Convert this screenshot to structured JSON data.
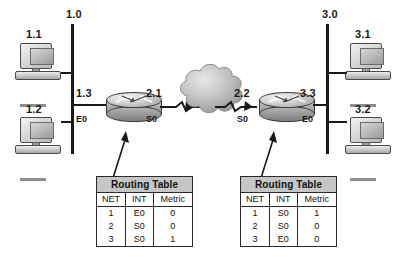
{
  "diagram": {
    "networks": [
      {
        "id": "net-left",
        "label": "1.0"
      },
      {
        "id": "net-right",
        "label": "3.0"
      }
    ],
    "workstations": [
      {
        "id": "pc-1-1",
        "label": "1.1"
      },
      {
        "id": "pc-1-2",
        "label": "1.2"
      },
      {
        "id": "pc-3-1",
        "label": "3.1"
      },
      {
        "id": "pc-3-2",
        "label": "3.2"
      }
    ],
    "routers": [
      {
        "id": "router-left",
        "left_address": "1.3",
        "left_interface": "E0",
        "right_address": "2.1",
        "right_interface": "S0"
      },
      {
        "id": "router-right",
        "left_address": "2.2",
        "left_interface": "S0",
        "right_address": "3.3",
        "right_interface": "E0"
      }
    ],
    "cloud": {
      "id": "wan-cloud",
      "label": ""
    },
    "routing_tables": [
      {
        "id": "routing-table-left",
        "caption": "Routing Table",
        "columns": [
          "NET",
          "INT",
          "Metric"
        ],
        "rows": [
          [
            "1",
            "E0",
            "0"
          ],
          [
            "2",
            "S0",
            "0"
          ],
          [
            "3",
            "S0",
            "1"
          ]
        ]
      },
      {
        "id": "routing-table-right",
        "caption": "Routing Table",
        "columns": [
          "NET",
          "INT",
          "Metric"
        ],
        "rows": [
          [
            "1",
            "S0",
            "1"
          ],
          [
            "2",
            "S0",
            "0"
          ],
          [
            "3",
            "E0",
            "0"
          ]
        ]
      }
    ],
    "colors": {
      "line": "#1a1a1a",
      "cloud": "#b0b0b0",
      "table_header": "#c6c6c6"
    }
  }
}
